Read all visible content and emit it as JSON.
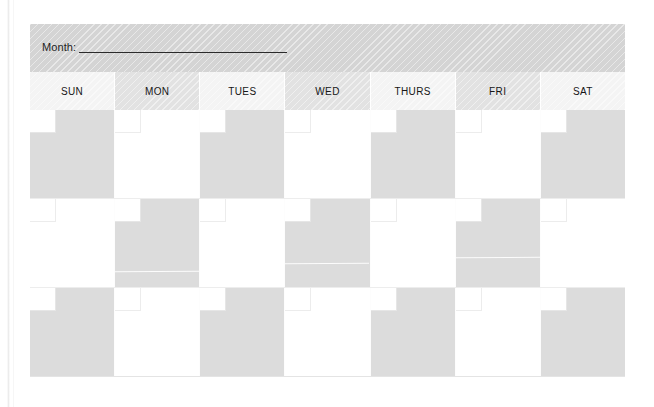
{
  "document": {
    "type": "blank-monthly-calendar-template",
    "orientation": "landscape"
  },
  "banner": {
    "month_label": "Month:",
    "month_value": "",
    "rule_name": "month-write-in-line",
    "background_color": "#d4d4d4"
  },
  "weekday_header": {
    "light_color": "#f4f4f4",
    "dark_color": "#e2e2e2",
    "days": [
      {
        "label": "SUN",
        "shade": "light"
      },
      {
        "label": "MON",
        "shade": "dark"
      },
      {
        "label": "TUES",
        "shade": "light"
      },
      {
        "label": "WED",
        "shade": "dark"
      },
      {
        "label": "THURS",
        "shade": "light"
      },
      {
        "label": "FRI",
        "shade": "dark"
      },
      {
        "label": "SAT",
        "shade": "light"
      }
    ]
  },
  "grid": {
    "columns": 7,
    "rows": 3,
    "shaded_color": "#dcdcdc",
    "plain_color": "#ffffff",
    "date_box_color": "#ffffff",
    "weeks": [
      {
        "index": 1,
        "cells": [
          {
            "day": "SUN",
            "shade": "shaded",
            "date": ""
          },
          {
            "day": "MON",
            "shade": "plain",
            "date": ""
          },
          {
            "day": "TUES",
            "shade": "shaded",
            "date": ""
          },
          {
            "day": "WED",
            "shade": "plain",
            "date": ""
          },
          {
            "day": "THURS",
            "shade": "shaded",
            "date": ""
          },
          {
            "day": "FRI",
            "shade": "plain",
            "date": ""
          },
          {
            "day": "SAT",
            "shade": "shaded",
            "date": ""
          }
        ]
      },
      {
        "index": 2,
        "cells": [
          {
            "day": "SUN",
            "shade": "plain",
            "date": ""
          },
          {
            "day": "MON",
            "shade": "shaded",
            "date": ""
          },
          {
            "day": "TUES",
            "shade": "plain",
            "date": ""
          },
          {
            "day": "WED",
            "shade": "shaded",
            "date": ""
          },
          {
            "day": "THURS",
            "shade": "plain",
            "date": ""
          },
          {
            "day": "FRI",
            "shade": "shaded",
            "date": ""
          },
          {
            "day": "SAT",
            "shade": "plain",
            "date": ""
          }
        ]
      },
      {
        "index": 3,
        "cells": [
          {
            "day": "SUN",
            "shade": "shaded",
            "date": ""
          },
          {
            "day": "MON",
            "shade": "plain",
            "date": ""
          },
          {
            "day": "TUES",
            "shade": "shaded",
            "date": ""
          },
          {
            "day": "WED",
            "shade": "plain",
            "date": ""
          },
          {
            "day": "THURS",
            "shade": "shaded",
            "date": ""
          },
          {
            "day": "FRI",
            "shade": "plain",
            "date": ""
          },
          {
            "day": "SAT",
            "shade": "shaded",
            "date": ""
          }
        ]
      }
    ]
  }
}
